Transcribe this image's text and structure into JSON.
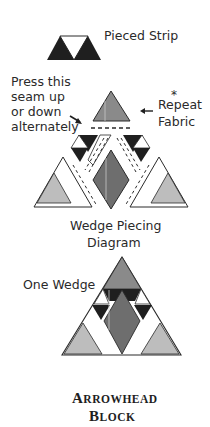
{
  "labels": {
    "pieced_strip": "Pieced Strip",
    "press_line1": "Press this",
    "press_line2": "seam up",
    "press_line3": "or down",
    "press_line4": "alternately",
    "repeat_asterisk": "*",
    "repeat_line1": "Repeat",
    "repeat_line2": "Fabric",
    "wedge_diagram_line1": "Wedge Piecing",
    "wedge_diagram_line2": "Diagram",
    "one_wedge": "One Wedge"
  },
  "title": {
    "line1_first": "A",
    "line1_rest": "RROWHEAD",
    "line2_first": "B",
    "line2_rest": "LOCK"
  },
  "colors": {
    "dark": "#1f1f1f",
    "medium": "#7a7a7a",
    "light": "#bdbdbd",
    "white": "#ffffff",
    "outline": "#2a2a2a"
  }
}
